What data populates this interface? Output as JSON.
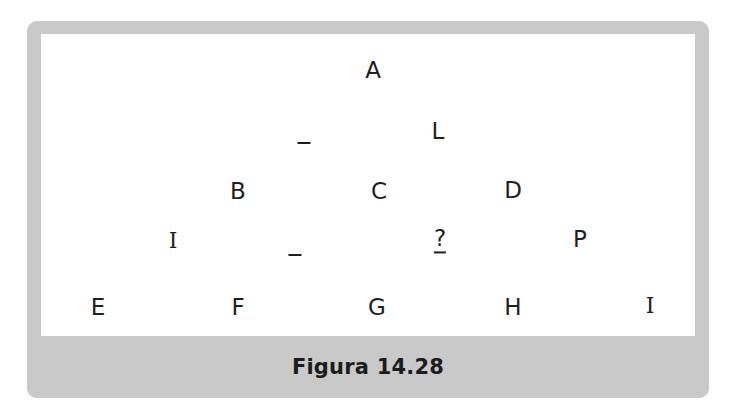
{
  "figure": {
    "caption": "Figura 14.28",
    "frame_color": "#c9c9c9",
    "canvas_color": "#ffffff",
    "ink_color": "#1f1f1f",
    "page_background": "#ffffff"
  },
  "diagram": {
    "type": "scattered-letter-grid",
    "rows": [
      {
        "row_name": "row-1",
        "nodes": [
          {
            "label": "A",
            "x": 373,
            "y": 70,
            "style": "sans"
          }
        ]
      },
      {
        "row_name": "row-2",
        "nodes": [
          {
            "label": "-",
            "x": 304,
            "y": 143,
            "style": "dash"
          },
          {
            "label": "L",
            "x": 438,
            "y": 131,
            "style": "sans"
          }
        ]
      },
      {
        "row_name": "row-3",
        "nodes": [
          {
            "label": "B",
            "x": 238,
            "y": 191,
            "style": "sans"
          },
          {
            "label": "C",
            "x": 379,
            "y": 191,
            "style": "sans"
          },
          {
            "label": "D",
            "x": 513,
            "y": 190,
            "style": "sans"
          }
        ]
      },
      {
        "row_name": "row-4",
        "nodes": [
          {
            "label": "I",
            "x": 173,
            "y": 241,
            "style": "serif"
          },
          {
            "label": "-",
            "x": 295,
            "y": 255,
            "style": "dash"
          },
          {
            "label": "?",
            "x": 440,
            "y": 240,
            "style": "query"
          },
          {
            "label": "P",
            "x": 580,
            "y": 239,
            "style": "sans"
          }
        ]
      },
      {
        "row_name": "row-5",
        "nodes": [
          {
            "label": "E",
            "x": 98,
            "y": 307,
            "style": "sans"
          },
          {
            "label": "F",
            "x": 238,
            "y": 307,
            "style": "sans"
          },
          {
            "label": "G",
            "x": 377,
            "y": 307,
            "style": "sans"
          },
          {
            "label": "H",
            "x": 513,
            "y": 307,
            "style": "sans"
          },
          {
            "label": "I",
            "x": 650,
            "y": 306,
            "style": "serif"
          }
        ]
      }
    ]
  }
}
